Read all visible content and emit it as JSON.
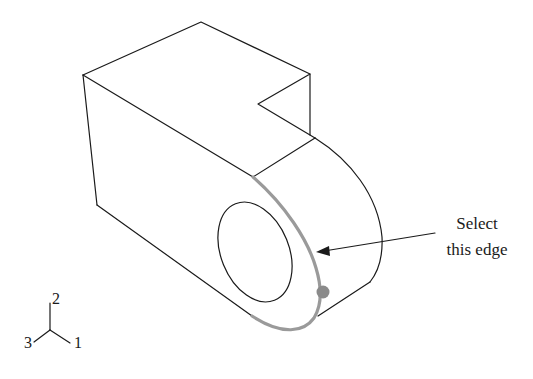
{
  "figure": {
    "annotation": {
      "line1": "Select",
      "line2": "this edge"
    },
    "triad": {
      "axis_up": "2",
      "axis_right": "1",
      "axis_left": "3"
    },
    "colors": {
      "edge": "#1a1a1a",
      "selected_edge": "#9a9a9a",
      "background": "#ffffff"
    }
  }
}
